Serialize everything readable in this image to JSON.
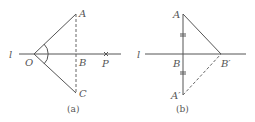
{
  "diagrams": [
    {
      "caption": "(a)",
      "labels": {
        "line": "l",
        "O": "O",
        "A": "A",
        "B": "B",
        "C": "C",
        "P": "P"
      }
    },
    {
      "caption": "(b)",
      "labels": {
        "line": "l",
        "A": "A",
        "B": "B",
        "A_prime": "A′",
        "B_prime": "B′"
      }
    }
  ],
  "colors": {
    "stroke": "#555555",
    "text": "#555555",
    "background": "#ffffff"
  }
}
